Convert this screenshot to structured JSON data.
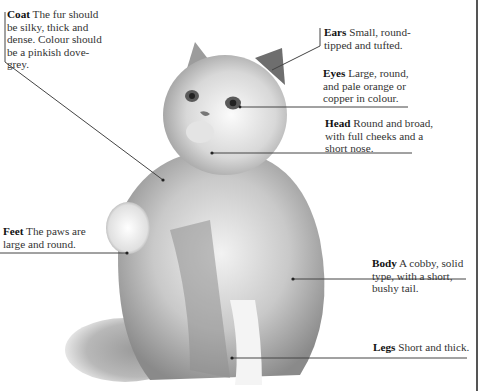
{
  "figure": {
    "border_color": "#555555",
    "line_color": "#444444"
  },
  "labels": {
    "coat": {
      "term": "Coat",
      "text": " The fur should be silky, thick and dense. Colour should be a pinkish dove-grey."
    },
    "ears": {
      "term": "Ears",
      "text": " Small, round-tipped and tufted."
    },
    "eyes": {
      "term": "Eyes",
      "text": " Large, round, and pale orange or copper in colour."
    },
    "head": {
      "term": "Head",
      "text": " Round and broad, with full cheeks and a short nose."
    },
    "feet": {
      "term": "Feet",
      "text": " The paws are large and round."
    },
    "body": {
      "term": "Body",
      "text": " A cobby, solid type, with a short, bushy tail."
    },
    "legs": {
      "term": "Legs",
      "text": " Short and thick."
    }
  }
}
